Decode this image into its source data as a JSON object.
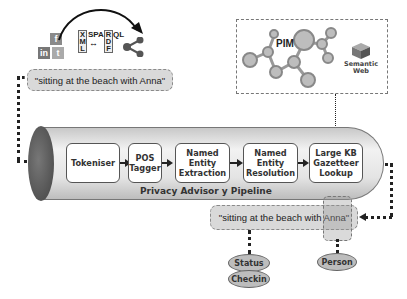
{
  "top_left": {
    "social_icons": [
      {
        "name": "facebook-icon",
        "glyph": "f"
      },
      {
        "name": "linkedin-icon",
        "glyph": "in"
      },
      {
        "name": "twitter-icon",
        "glyph": "t"
      }
    ],
    "xml_letters": "X\nM\nL",
    "sparql_text": "SPA",
    "rdf_letters": "R\nD\nF",
    "ql_text": "QL",
    "double_arrow": "↔",
    "share_icon": "share-icon"
  },
  "input_quote": "\"sitting at the beach with Anna\"",
  "pim_panel": {
    "pim_label": "PIM",
    "semantic_web_label": "Semantic\nWeb"
  },
  "pipeline": {
    "title": "Privacy Advisor y Pipeline",
    "stages": [
      {
        "label": "Tokeniser"
      },
      {
        "label": "POS\nTagger"
      },
      {
        "label": "Named\nEntity\nExtraction"
      },
      {
        "label": "Named\nEntity\nResolution"
      },
      {
        "label": "Large KB\nGazetteer\nLookup"
      }
    ]
  },
  "output": {
    "quote": "\"sitting at the beach with Anna\"",
    "annotations": [
      {
        "label": "Status"
      },
      {
        "label": "Checkin"
      },
      {
        "label": "Person"
      }
    ]
  },
  "colors": {
    "cylinder_end": "#555555",
    "quote_box": "#d9d9d9",
    "ellipse": "#bdbdbd"
  }
}
